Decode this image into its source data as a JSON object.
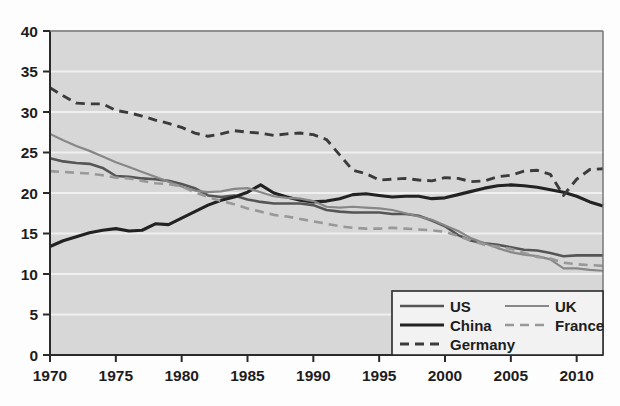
{
  "chart_data": {
    "type": "line",
    "title": "",
    "xlabel": "",
    "ylabel": "",
    "xlim": [
      1970,
      2012
    ],
    "ylim": [
      0,
      40
    ],
    "grid": true,
    "grid_orientation": "horizontal",
    "legend_position": "bottom-right",
    "plot_background": "#d7d7d7",
    "page_background": "#fdfdfd",
    "x_ticks": [
      1970,
      1975,
      1980,
      1985,
      1990,
      1995,
      2000,
      2005,
      2010
    ],
    "x_tick_labels": [
      "1970",
      "1975",
      "1980",
      "1985",
      "1990",
      "1995",
      "2000",
      "2005",
      "2010"
    ],
    "y_ticks": [
      0,
      5,
      10,
      15,
      20,
      25,
      30,
      35,
      40
    ],
    "y_tick_labels": [
      "0",
      "5",
      "10",
      "15",
      "20",
      "25",
      "30",
      "35",
      "40"
    ],
    "x": [
      1970,
      1971,
      1972,
      1973,
      1974,
      1975,
      1976,
      1977,
      1978,
      1979,
      1980,
      1981,
      1982,
      1983,
      1984,
      1985,
      1986,
      1987,
      1988,
      1989,
      1990,
      1991,
      1992,
      1993,
      1994,
      1995,
      1996,
      1997,
      1998,
      1999,
      2000,
      2001,
      2002,
      2003,
      2004,
      2005,
      2006,
      2007,
      2008,
      2009,
      2010,
      2011,
      2012
    ],
    "series": [
      {
        "name": "US",
        "color": "#555555",
        "width": 2.6,
        "style": "solid",
        "values": [
          24.3,
          23.9,
          23.7,
          23.6,
          23.1,
          22.1,
          22.0,
          21.8,
          21.7,
          21.5,
          21.1,
          20.6,
          19.7,
          19.5,
          19.7,
          19.2,
          18.9,
          18.7,
          18.7,
          18.7,
          18.5,
          17.9,
          17.7,
          17.6,
          17.6,
          17.6,
          17.4,
          17.4,
          17.2,
          16.6,
          15.9,
          14.8,
          14.1,
          13.8,
          13.6,
          13.3,
          13.0,
          12.9,
          12.6,
          12.2,
          12.3,
          12.3,
          12.3
        ]
      },
      {
        "name": "China",
        "color": "#222222",
        "width": 3.1,
        "style": "solid",
        "values": [
          13.4,
          14.1,
          14.6,
          15.1,
          15.4,
          15.6,
          15.3,
          15.4,
          16.2,
          16.1,
          16.9,
          17.7,
          18.5,
          19.1,
          19.5,
          20.1,
          21.0,
          20.0,
          19.5,
          19.1,
          18.9,
          19.0,
          19.3,
          19.8,
          19.9,
          19.7,
          19.5,
          19.6,
          19.6,
          19.3,
          19.4,
          19.8,
          20.2,
          20.6,
          20.9,
          21.0,
          20.9,
          20.7,
          20.4,
          20.1,
          19.6,
          18.9,
          18.4
        ]
      },
      {
        "name": "Germany",
        "color": "#3b3b3b",
        "width": 2.9,
        "style": "dashed",
        "values": [
          33.0,
          32.0,
          31.1,
          31.0,
          31.0,
          30.2,
          29.9,
          29.5,
          29.0,
          28.6,
          28.1,
          27.4,
          27.0,
          27.3,
          27.7,
          27.5,
          27.4,
          27.1,
          27.3,
          27.4,
          27.2,
          26.6,
          24.7,
          22.8,
          22.4,
          21.6,
          21.7,
          21.8,
          21.6,
          21.5,
          21.9,
          21.8,
          21.4,
          21.5,
          22.0,
          22.2,
          22.7,
          22.8,
          22.3,
          19.7,
          21.7,
          22.9,
          23.0
        ]
      },
      {
        "name": "UK",
        "color": "#878787",
        "width": 2.2,
        "style": "solid",
        "values": [
          27.3,
          26.5,
          25.8,
          25.2,
          24.5,
          23.8,
          23.2,
          22.6,
          22.0,
          21.4,
          20.8,
          20.3,
          20.1,
          20.2,
          20.5,
          20.6,
          20.1,
          19.6,
          19.4,
          19.3,
          19.0,
          18.3,
          18.2,
          18.3,
          18.2,
          18.1,
          17.9,
          17.5,
          17.1,
          16.7,
          16.0,
          15.3,
          14.4,
          13.8,
          13.2,
          12.7,
          12.4,
          12.2,
          11.8,
          10.7,
          10.7,
          10.5,
          10.4
        ]
      },
      {
        "name": "France",
        "color": "#989898",
        "width": 2.6,
        "style": "dashed",
        "values": [
          22.7,
          22.6,
          22.5,
          22.4,
          22.2,
          21.9,
          21.8,
          21.5,
          21.2,
          21.1,
          20.8,
          20.1,
          19.5,
          19.0,
          18.6,
          18.1,
          17.7,
          17.3,
          17.1,
          16.8,
          16.5,
          16.2,
          15.9,
          15.7,
          15.6,
          15.6,
          15.7,
          15.6,
          15.5,
          15.4,
          15.2,
          14.7,
          14.1,
          13.6,
          13.4,
          13.1,
          12.6,
          12.1,
          11.9,
          11.4,
          11.2,
          11.1,
          11.0
        ]
      }
    ]
  },
  "legend": {
    "entries": [
      {
        "label": "US",
        "key": "US"
      },
      {
        "label": "UK",
        "key": "UK"
      },
      {
        "label": "China",
        "key": "China"
      },
      {
        "label": "France",
        "key": "France"
      },
      {
        "label": "Germany",
        "key": "Germany"
      }
    ]
  }
}
